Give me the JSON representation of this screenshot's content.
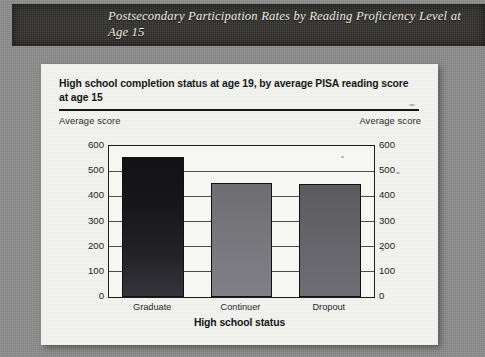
{
  "banner": {
    "title": "Postsecondary Participation Rates by Reading Proficiency Level at Age 15"
  },
  "card": {
    "title": "High school completion status at age 19, by average PISA reading score at age 15",
    "left_axis_caption": "Average score",
    "right_axis_caption": "Average score",
    "x_axis_title": "High school status"
  },
  "chart_data": {
    "type": "bar",
    "title": "High school completion status at age 19, by average PISA reading score at age 15",
    "categories": [
      "Graduate",
      "Continuer",
      "Dropout"
    ],
    "values": [
      555,
      452,
      448
    ],
    "series": [
      {
        "name": "Average PISA reading score at age 15",
        "values": [
          555,
          452,
          448
        ]
      }
    ],
    "xlabel": "High school status",
    "ylabel": "Average score",
    "ylabel_right": "Average score",
    "ylim": [
      0,
      600
    ],
    "yticks": [
      0,
      100,
      200,
      300,
      400,
      500,
      600
    ],
    "ytick_labels": [
      "0",
      "100",
      "200",
      "300",
      "400",
      "500",
      "600"
    ],
    "grid": true,
    "grid_axis": "y",
    "legend": false,
    "bar_colors": [
      "#17171a",
      "#75757a",
      "#636368"
    ]
  },
  "colors": {
    "page_background": "#8d8d8d",
    "banner_background": "#33322f",
    "banner_text": "#efece4",
    "card_background": "#f2f2ef",
    "axis": "#1d1d20",
    "grid": "#4c4c50",
    "text": "#17171a"
  }
}
